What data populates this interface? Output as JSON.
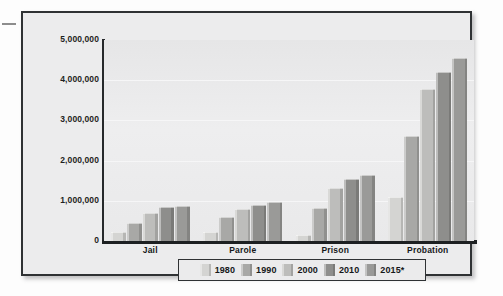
{
  "chart_data": {
    "type": "bar",
    "title": "",
    "xlabel": "",
    "ylabel": "",
    "ylim": [
      0,
      5000000
    ],
    "ytick_labels": [
      "5,000,000",
      "4,000,000",
      "3,000,000",
      "2,000,000",
      "1,000,000",
      "0"
    ],
    "ytick_values": [
      5000000,
      4000000,
      3000000,
      2000000,
      1000000,
      0
    ],
    "grid": true,
    "legend_position": "bottom",
    "categories": [
      "Jail",
      "Parole",
      "Prison",
      "Probation"
    ],
    "series": [
      {
        "name": "1980",
        "color": "#d4d4d2",
        "values": [
          220000,
          230000,
          140000,
          1100000
        ]
      },
      {
        "name": "1990",
        "color": "#a8a8a6",
        "values": [
          450000,
          600000,
          820000,
          2600000
        ]
      },
      {
        "name": "2000",
        "color": "#bdbdbb",
        "values": [
          690000,
          800000,
          1320000,
          3780000
        ]
      },
      {
        "name": "2010",
        "color": "#8e8e8c",
        "values": [
          850000,
          890000,
          1540000,
          4200000
        ]
      },
      {
        "name": "2015*",
        "color": "#9a9a98",
        "values": [
          880000,
          960000,
          1630000,
          4550000
        ]
      }
    ]
  },
  "legend": {
    "items": [
      "1980",
      "1990",
      "2000",
      "2010",
      "2015*"
    ]
  },
  "colors": {
    "frame_border": "#2f3234",
    "plot_background": "#eaeaeb",
    "axis": "#1d2022",
    "text": "#16181a"
  }
}
